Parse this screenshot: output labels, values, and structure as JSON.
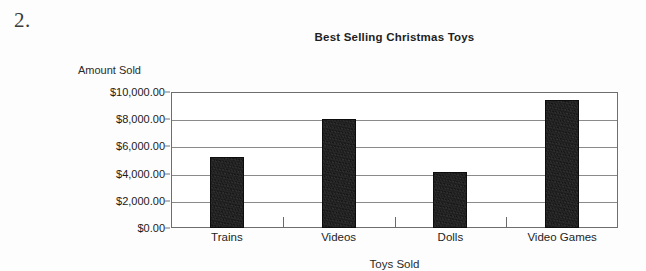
{
  "worksheet": {
    "question_number": "2."
  },
  "chart_data": {
    "type": "bar",
    "title": "Best Selling Christmas Toys",
    "xlabel": "Toys Sold",
    "ylabel": "Amount Sold",
    "categories": [
      "Trains",
      "Videos",
      "Dolls",
      "Video Games"
    ],
    "values": [
      5200,
      8000,
      4100,
      9400
    ],
    "ylim": [
      0,
      10000
    ],
    "ytick_values": [
      0,
      2000,
      4000,
      6000,
      8000,
      10000
    ],
    "ytick_labels": [
      "$0.00",
      "$2,000.00",
      "$4,000.00",
      "$6,000.00",
      "$8,000.00",
      "$10,000.00"
    ],
    "grid": true,
    "legend": false,
    "bar_color": "#141414",
    "grid_color": "#8a8a8a",
    "frame_color": "#6e6e6e"
  }
}
